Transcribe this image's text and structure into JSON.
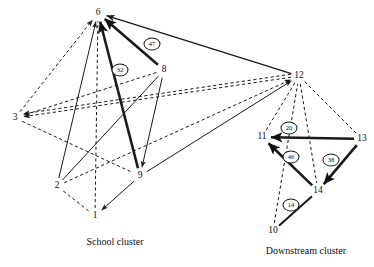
{
  "figure": {
    "type": "network-diagram",
    "background": "#ffffff",
    "line_color": "#1a1a1a",
    "width": 374,
    "height": 267
  },
  "captions": [
    {
      "name": "school-cluster-caption",
      "text": "School cluster",
      "x": 115,
      "y": 241
    },
    {
      "name": "downstream-cluster-caption",
      "text": "Downstream cluster",
      "x": 306,
      "y": 250
    }
  ],
  "nodes": [
    {
      "id": "1",
      "label": "1",
      "x": 95,
      "y": 216,
      "cluster": "school"
    },
    {
      "id": "2",
      "label": "2",
      "x": 57,
      "y": 186,
      "cluster": "school"
    },
    {
      "id": "3",
      "label": "3",
      "x": 15,
      "y": 118,
      "cluster": "school"
    },
    {
      "id": "6",
      "label": "6",
      "x": 98,
      "y": 13,
      "cluster": "school"
    },
    {
      "id": "8",
      "label": "8",
      "x": 164,
      "y": 70,
      "cluster": "school"
    },
    {
      "id": "9",
      "label": "9",
      "x": 140,
      "y": 176,
      "cluster": "school"
    },
    {
      "id": "10",
      "label": "10",
      "x": 273,
      "y": 231,
      "cluster": "downstream"
    },
    {
      "id": "11",
      "label": "11",
      "x": 262,
      "y": 137,
      "cluster": "downstream"
    },
    {
      "id": "12",
      "label": "12",
      "x": 299,
      "y": 76,
      "cluster": "downstream"
    },
    {
      "id": "13",
      "label": "13",
      "x": 362,
      "y": 139,
      "cluster": "downstream"
    },
    {
      "id": "14",
      "label": "14",
      "x": 318,
      "y": 191,
      "cluster": "downstream"
    }
  ],
  "edge_labels": [
    {
      "name": "edge-label-47",
      "value": "47",
      "x": 152,
      "y": 44,
      "edge": "8->6"
    },
    {
      "name": "edge-label-32",
      "value": "32",
      "x": 120,
      "y": 70,
      "edge": "9->6"
    },
    {
      "name": "edge-label-20",
      "value": "20",
      "x": 289,
      "y": 128,
      "edge": "13->11"
    },
    {
      "name": "edge-label-46",
      "value": "46",
      "x": 291,
      "y": 157,
      "edge": "14->11"
    },
    {
      "name": "edge-label-38",
      "value": "38",
      "x": 331,
      "y": 160,
      "edge": "13->14"
    },
    {
      "name": "edge-label-14",
      "value": "14",
      "x": 291,
      "y": 205,
      "edge": "10->14"
    }
  ],
  "edges": [
    {
      "name": "edge-3-to-6",
      "from": "3",
      "to": "6",
      "style": "dashed",
      "weight": 1,
      "arrow": true
    },
    {
      "name": "edge-2-to-6",
      "from": "2",
      "to": "6",
      "style": "solid",
      "weight": 1,
      "arrow": true
    },
    {
      "name": "edge-1-to-6",
      "from": "1",
      "to": "6",
      "style": "dashed",
      "weight": 1,
      "arrow": false
    },
    {
      "name": "edge-9-to-6",
      "from": "9",
      "to": "6",
      "style": "solid",
      "weight": 2.6,
      "arrow": true
    },
    {
      "name": "edge-8-to-6",
      "from": "8",
      "to": "6",
      "style": "solid",
      "weight": 2.6,
      "arrow": true
    },
    {
      "name": "edge-12-to-6",
      "from": "12",
      "to": "6",
      "style": "solid",
      "weight": 1.3,
      "arrow": true
    },
    {
      "name": "edge-8-to-3",
      "from": "8",
      "to": "3",
      "style": "dashed",
      "weight": 1,
      "arrow": true
    },
    {
      "name": "edge-12-to-3a",
      "from": "12",
      "to": "3",
      "style": "dashed",
      "weight": 1,
      "arrow": true
    },
    {
      "name": "edge-12-to-3b",
      "from": "12",
      "to": "3",
      "style": "dashed",
      "weight": 1,
      "arrow": true
    },
    {
      "name": "edge-3-to-9",
      "from": "3",
      "to": "9",
      "style": "dashed",
      "weight": 1,
      "arrow": false
    },
    {
      "name": "edge-2-to-1",
      "from": "2",
      "to": "1",
      "style": "dashed",
      "weight": 1,
      "arrow": false
    },
    {
      "name": "edge-9-to-1",
      "from": "9",
      "to": "1",
      "style": "solid",
      "weight": 1,
      "arrow": true
    },
    {
      "name": "edge-2-to-8",
      "from": "2",
      "to": "8",
      "style": "solid",
      "weight": 1,
      "arrow": false
    },
    {
      "name": "edge-8-to-9",
      "from": "8",
      "to": "9",
      "style": "solid",
      "weight": 1,
      "arrow": true
    },
    {
      "name": "edge-2-to-12",
      "from": "2",
      "to": "12",
      "style": "dashed",
      "weight": 1,
      "arrow": true
    },
    {
      "name": "edge-9-to-12",
      "from": "9",
      "to": "12",
      "style": "solid",
      "weight": 1,
      "arrow": true
    },
    {
      "name": "edge-10-to-12",
      "from": "10",
      "to": "12",
      "style": "dashed",
      "weight": 1,
      "arrow": false
    },
    {
      "name": "edge-12-to-11",
      "from": "12",
      "to": "11",
      "style": "dashed",
      "weight": 1,
      "arrow": false
    },
    {
      "name": "edge-12-to-13",
      "from": "12",
      "to": "13",
      "style": "dashed",
      "weight": 1,
      "arrow": false
    },
    {
      "name": "edge-12-to-14",
      "from": "12",
      "to": "14",
      "style": "dashed",
      "weight": 1,
      "arrow": false
    },
    {
      "name": "edge-13-to-11",
      "from": "13",
      "to": "11",
      "style": "solid",
      "weight": 2.6,
      "arrow": true
    },
    {
      "name": "edge-14-to-11",
      "from": "14",
      "to": "11",
      "style": "solid",
      "weight": 2.6,
      "arrow": true
    },
    {
      "name": "edge-13-to-14",
      "from": "13",
      "to": "14",
      "style": "solid",
      "weight": 2.6,
      "arrow": true
    },
    {
      "name": "edge-10-to-14",
      "from": "10",
      "to": "14",
      "style": "solid",
      "weight": 2.0,
      "arrow": false
    }
  ]
}
